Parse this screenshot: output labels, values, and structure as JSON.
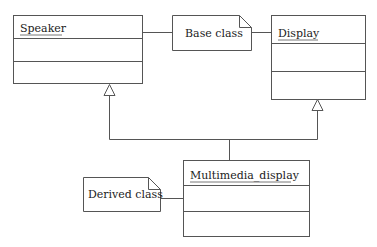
{
  "diagram": {
    "type": "UML class diagram - multiple inheritance",
    "classes": [
      {
        "id": "speaker",
        "name": "Speaker"
      },
      {
        "id": "display",
        "name": "Display"
      },
      {
        "id": "multimedia_display",
        "name": "Multimedia_display"
      }
    ],
    "notes": [
      {
        "id": "base_note",
        "text": "Base class"
      },
      {
        "id": "derived_note",
        "text": "Derived class"
      }
    ],
    "relations": [
      {
        "from": "multimedia_display",
        "to": "speaker",
        "type": "generalization"
      },
      {
        "from": "multimedia_display",
        "to": "display",
        "type": "generalization"
      }
    ],
    "colors": {
      "line": "#555555",
      "text": "#222222",
      "background": "#ffffff"
    }
  }
}
